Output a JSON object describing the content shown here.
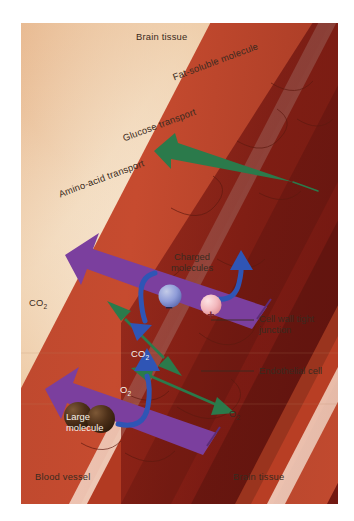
{
  "figure": {
    "type": "biological-cross-section"
  },
  "regions": {
    "brain_tissue_top": "Brain tissue",
    "brain_tissue_bottom": "Brain tissue",
    "blood_vessel": "Blood vessel"
  },
  "transport_arrows": [
    {
      "id": "fat-soluble",
      "label": "Fat-soluble molecule",
      "color": "#2b7a4b",
      "direction": "vessel-to-brain",
      "style": "single-headed",
      "crosses_barrier": true
    },
    {
      "id": "glucose",
      "label": "Glucose transport",
      "color": "#7b3f9e",
      "direction": "vessel-to-brain",
      "style": "single-headed",
      "crosses_barrier": true
    },
    {
      "id": "amino-acid",
      "label": "Amino-acid transport",
      "color": "#7b3f9e",
      "direction": "vessel-to-brain",
      "style": "single-headed",
      "crosses_barrier": true
    },
    {
      "id": "co2",
      "label_outer": "CO2",
      "label_inner": "CO2",
      "color": "#2b7a4b",
      "direction": "bidirectional",
      "style": "double-headed",
      "crosses_barrier": true
    },
    {
      "id": "o2",
      "label_inner": "O2",
      "label_outer": "O2",
      "color": "#2b7a4b",
      "direction": "bidirectional",
      "style": "double-headed",
      "crosses_barrier": true
    }
  ],
  "blocked": [
    {
      "id": "charged-molecules",
      "label_line1": "Charged",
      "label_line2": "molecules",
      "color": "#2f55b5",
      "negative_ion_symbol": "−",
      "negative_ion_color": "#8c9ad6",
      "positive_ion_symbol": "+",
      "positive_ion_color": "#f0b8bc",
      "style": "rebound-arrows",
      "crosses_barrier": false
    },
    {
      "id": "large-molecule",
      "label_line1": "Large",
      "label_line2": "molecule",
      "color": "#2f55b5",
      "sphere_color": "#4a2d18",
      "sphere_count": 2,
      "style": "u-turn-arrow",
      "crosses_barrier": false
    }
  ],
  "callouts": [
    {
      "id": "cell-wall-tight-junction",
      "line1": "Cell wall tight",
      "line2": "junction",
      "leader": true
    },
    {
      "id": "endothelial-cell",
      "line1": "Endothelial cell",
      "line2": "",
      "leader": true
    }
  ],
  "palette": {
    "background_tan": "#e8b787",
    "background_cream": "#f7e3cc",
    "vessel_wall_red": "#c0462c",
    "vessel_lumen_dark": "#6d140f",
    "vessel_stripe_pale": "#eec3b2",
    "green": "#2b7a4b",
    "purple": "#7b3f9e",
    "blue": "#2f55b5",
    "text_brown": "#3a2a20",
    "text_white": "#f7f2ea"
  },
  "subscripts": {
    "co2_sub": "2",
    "o2_sub": "2",
    "co2_base": "CO",
    "o2_base": "O"
  }
}
